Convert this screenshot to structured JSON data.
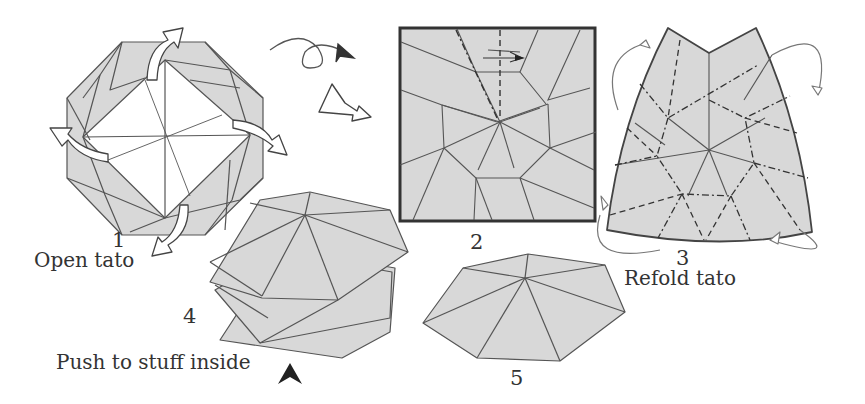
{
  "diagram": {
    "colors": {
      "paper": "#d8d8d8",
      "paper_white": "#ffffff",
      "line": "#555555",
      "border": "#333333",
      "arrow_fill": "#ffffff",
      "push_arrow": "#222222"
    },
    "steps": [
      {
        "number": "1",
        "caption": "Open tato",
        "icon": "octagon-tato-open"
      },
      {
        "number": "2",
        "caption": "",
        "icon": "square-crease-pattern"
      },
      {
        "number": "3",
        "caption": "Refold tato",
        "icon": "refold-crease-pattern"
      },
      {
        "number": "4",
        "caption": "Push to stuff inside",
        "icon": "heptagon-stuffing"
      },
      {
        "number": "5",
        "caption": "",
        "icon": "heptagon-finished"
      }
    ],
    "symbols": {
      "turn_over": "turn-over-icon",
      "next_step": "hollow-arrow-icon",
      "push": "push-arrow-icon"
    }
  }
}
